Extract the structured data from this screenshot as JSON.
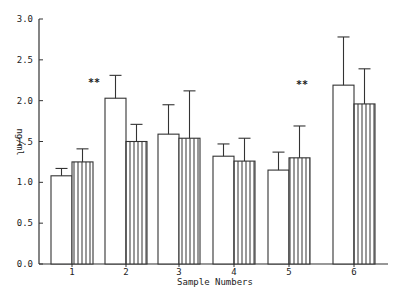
{
  "chart_data": {
    "type": "bar",
    "title": "",
    "xlabel": "Sample Numbers",
    "ylabel": "ng/ml",
    "ylim": [
      0,
      3.0
    ],
    "yticks": [
      "0.0",
      "0.5",
      "1.0",
      "1.5",
      "2.0",
      "2.5",
      "3.0"
    ],
    "ytick_values": [
      0,
      0.5,
      1.0,
      1.5,
      2.0,
      2.5,
      3.0
    ],
    "categories": [
      "1",
      "2",
      "3",
      "4",
      "5",
      "6"
    ],
    "grid": false,
    "legend": "none",
    "series": [
      {
        "name": "open",
        "pattern": "open",
        "values": [
          1.08,
          2.03,
          1.59,
          1.32,
          1.15,
          2.19
        ],
        "error_upper": [
          1.17,
          2.31,
          1.95,
          1.47,
          1.37,
          2.78
        ]
      },
      {
        "name": "hatched",
        "pattern": "vertical-hatch",
        "values": [
          1.25,
          1.5,
          1.54,
          1.26,
          1.3,
          1.96
        ],
        "error_upper": [
          1.41,
          1.71,
          2.12,
          1.54,
          1.69,
          2.39
        ]
      }
    ],
    "annotations": [
      {
        "text": "**",
        "category": "2",
        "near_value": 2.2
      },
      {
        "text": "**",
        "category": "5",
        "near_value": 2.2
      }
    ]
  }
}
